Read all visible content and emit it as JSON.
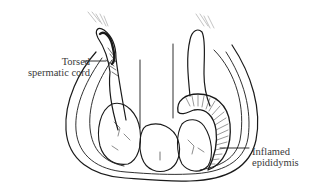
{
  "figure": {
    "labels": {
      "torsed_cord": {
        "line1": "Torsed",
        "line2": "spermatic cord"
      },
      "inflamed_epididymis": {
        "line1": "Inflamed",
        "line2": "epididymis"
      }
    },
    "colors": {
      "ink": "#1a1a1a",
      "text": "#3a3a3a",
      "background": "#ffffff"
    }
  }
}
